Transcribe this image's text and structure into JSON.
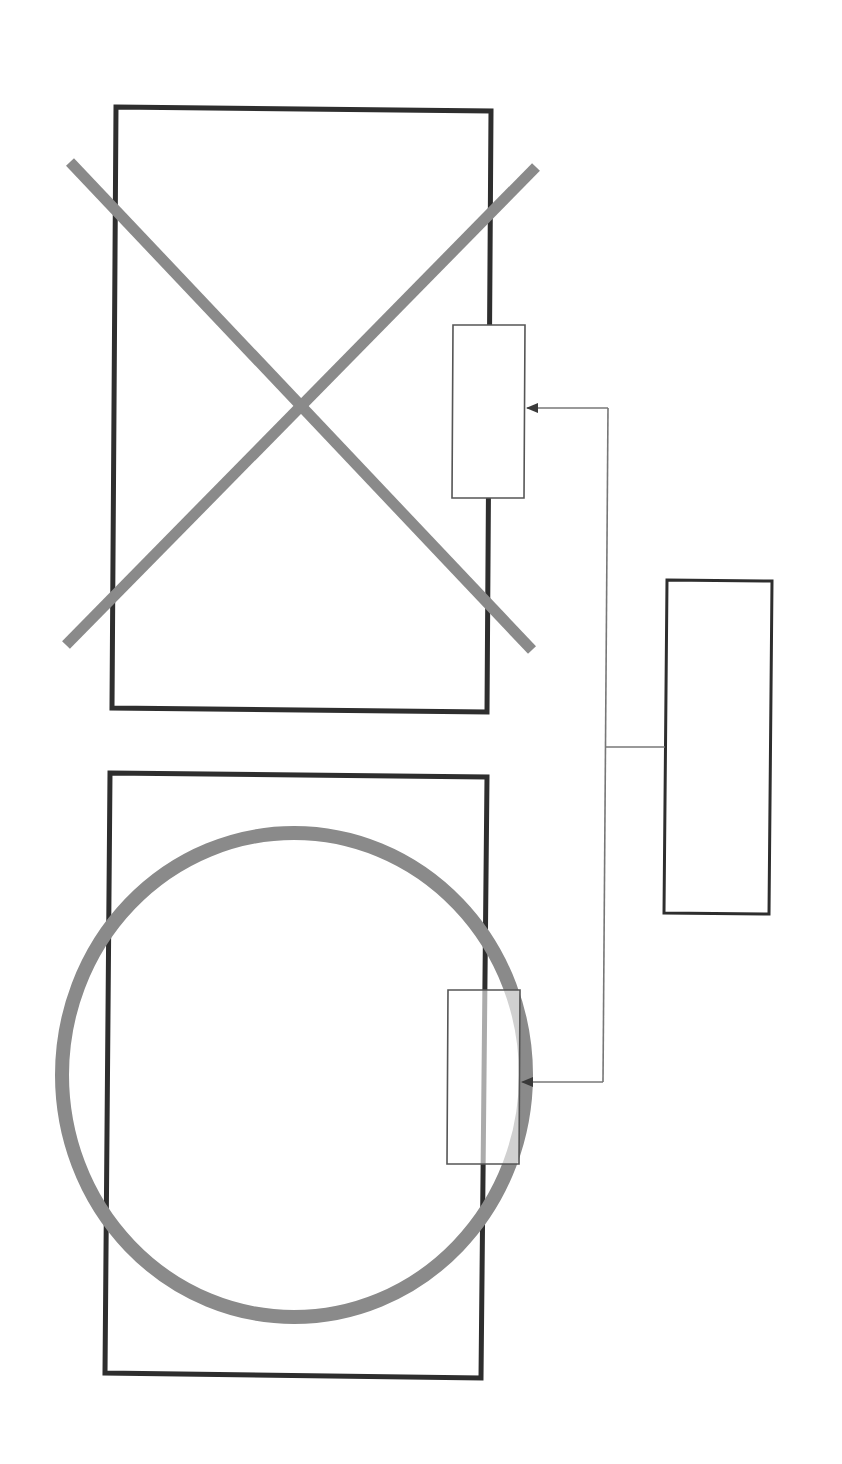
{
  "diagram": {
    "type": "line-drawing",
    "text_labels": [],
    "colors": {
      "background": "#ffffff",
      "frame_stroke": "#2e2e2e",
      "symbol_stroke": "#8a8a8a",
      "module_stroke": "#555555",
      "connector_stroke": "#777777",
      "arrowhead_fill": "#3a3a3a"
    },
    "panels": [
      {
        "id": "top-panel",
        "shape": "rectangle",
        "corners": [
          [
            116,
            107
          ],
          [
            491,
            111
          ],
          [
            487,
            712
          ],
          [
            112,
            708
          ]
        ],
        "overlay_symbol": "cross-x",
        "attached_module": {
          "corners": [
            [
              453,
              325
            ],
            [
              525,
              325
            ],
            [
              524,
              498
            ],
            [
              452,
              498
            ]
          ]
        }
      },
      {
        "id": "bottom-panel",
        "shape": "rectangle",
        "corners": [
          [
            110,
            773
          ],
          [
            487,
            777
          ],
          [
            481,
            1378
          ],
          [
            105,
            1373
          ]
        ],
        "overlay_symbol": "circle-o",
        "attached_module": {
          "corners": [
            [
              448,
              990
            ],
            [
              520,
              990
            ],
            [
              519,
              1164
            ],
            [
              447,
              1164
            ]
          ]
        }
      }
    ],
    "cross_symbol": {
      "stroke_width": 11,
      "line_a": [
        [
          70,
          162
        ],
        [
          532,
          650
        ]
      ],
      "line_b": [
        [
          536,
          167
        ],
        [
          66,
          645
        ]
      ]
    },
    "circle_symbol": {
      "cx": 294,
      "cy": 1075,
      "rx": 232,
      "ry": 242,
      "stroke_width": 14
    },
    "controller_box": {
      "corners": [
        [
          667,
          580
        ],
        [
          772,
          581
        ],
        [
          769,
          914
        ],
        [
          664,
          913
        ]
      ]
    },
    "connectors": {
      "trunk": [
        [
          608,
          408
        ],
        [
          603,
          1082
        ]
      ],
      "to_controller": [
        [
          606,
          747
        ],
        [
          665,
          747
        ]
      ],
      "to_top_module": [
        [
          608,
          408
        ],
        [
          526,
          408
        ]
      ],
      "to_bottom_module": [
        [
          603,
          1082
        ],
        [
          521,
          1082
        ]
      ]
    }
  }
}
